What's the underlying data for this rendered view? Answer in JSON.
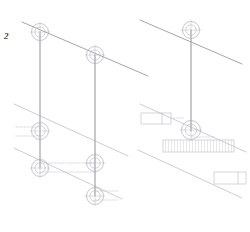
{
  "sheet": {
    "width": 250,
    "height": 232,
    "background": "#ffffff",
    "detail_number": "2",
    "detail_label_x": 4,
    "detail_label_y": 32
  },
  "styles": {
    "diagonal_color": "#8e8e96",
    "rail_color": "#b6b6be",
    "post_color": "#a9a9b2",
    "node_stroke": "#a9a9b4",
    "node_inner_stroke": "#bcbcc6",
    "leader_color": "#c2c2cc",
    "box_stroke": "#c0c0ca",
    "hatch_color": "#cfcfd8",
    "diagonal_width": 0.8,
    "rail_width": 0.7,
    "post_width": 1.3,
    "node_width": 0.65,
    "leader_width": 0.6,
    "box_width": 0.65
  },
  "panels": [
    {
      "name": "left-detail-panel",
      "diagonals": [
        {
          "name": "upper-chord-line",
          "x1": 22,
          "y1": 22,
          "x2": 148,
          "y2": 76
        },
        {
          "name": "mid-band-upper-line",
          "x1": 14,
          "y1": 104,
          "x2": 128,
          "y2": 156
        },
        {
          "name": "mid-band-lower-line",
          "x1": 14,
          "y1": 148,
          "x2": 122,
          "y2": 199
        }
      ],
      "posts": [
        {
          "name": "vertical-post-left",
          "x": 40,
          "y1": 32,
          "x2": 40,
          "y2": 168
        },
        {
          "name": "vertical-post-right",
          "x": 95,
          "y1": 55,
          "x2": 95,
          "y2": 196
        }
      ],
      "nodes": [
        {
          "name": "node-upper-left",
          "cx": 40,
          "cy": 32,
          "r": 8.5,
          "r_inner": 5.2
        },
        {
          "name": "node-upper-right",
          "cx": 95,
          "cy": 55,
          "r": 8.5,
          "r_inner": 5.2
        },
        {
          "name": "node-mid-left",
          "cx": 40,
          "cy": 131,
          "r": 8.5,
          "r_inner": 5.2
        },
        {
          "name": "node-lower-left",
          "cx": 40,
          "cy": 168,
          "r": 8.5,
          "r_inner": 5.2
        },
        {
          "name": "node-lower-mid",
          "cx": 95,
          "cy": 163,
          "r": 8.5,
          "r_inner": 5.2
        },
        {
          "name": "node-lower-right",
          "cx": 95,
          "cy": 196,
          "r": 8.5,
          "r_inner": 5.2
        }
      ],
      "leaders": [
        {
          "name": "leader-mid-left-upper",
          "x1": 16,
          "y1": 127,
          "x2": 40,
          "y2": 127
        },
        {
          "name": "leader-mid-left-lower",
          "x1": 16,
          "y1": 136,
          "x2": 40,
          "y2": 136
        },
        {
          "name": "leader-cross-upper",
          "x1": 40,
          "y1": 163,
          "x2": 95,
          "y2": 163
        },
        {
          "name": "leader-cross-lower",
          "x1": 40,
          "y1": 172,
          "x2": 95,
          "y2": 172
        },
        {
          "name": "leader-lower-right-upper",
          "x1": 95,
          "y1": 191,
          "x2": 118,
          "y2": 191
        },
        {
          "name": "leader-lower-right-lower",
          "x1": 95,
          "y1": 200,
          "x2": 118,
          "y2": 200
        }
      ]
    },
    {
      "name": "right-detail-panel",
      "diagonals": [
        {
          "name": "upper-chord-line",
          "x1": 140,
          "y1": 20,
          "x2": 242,
          "y2": 64
        },
        {
          "name": "mid-band-upper-line",
          "x1": 140,
          "y1": 104,
          "x2": 246,
          "y2": 152
        },
        {
          "name": "mid-band-lower-line",
          "x1": 138,
          "y1": 150,
          "x2": 242,
          "y2": 198
        }
      ],
      "posts": [
        {
          "name": "vertical-post-center",
          "x": 191,
          "y1": 30,
          "x2": 191,
          "y2": 131
        }
      ],
      "nodes": [
        {
          "name": "node-upper-center",
          "cx": 191,
          "cy": 30,
          "r": 8.5,
          "r_inner": 5.2
        },
        {
          "name": "node-mid-center",
          "cx": 191,
          "cy": 130,
          "r": 9.5,
          "r_inner": 5.8
        }
      ],
      "leaders": [
        {
          "name": "leader-mid-center-right",
          "x1": 191,
          "y1": 137,
          "x2": 214,
          "y2": 137
        }
      ],
      "boxes": [
        {
          "name": "callout-box-left",
          "x": 141,
          "y": 113,
          "w": 30,
          "h": 11,
          "hatched": false,
          "divider_x": 162
        },
        {
          "name": "callout-box-center",
          "x": 163,
          "y": 140,
          "w": 71,
          "h": 12,
          "hatched": true,
          "divider_x": null
        },
        {
          "name": "callout-box-right",
          "x": 214,
          "y": 172,
          "w": 32,
          "h": 12,
          "hatched": false,
          "divider_x": 238
        }
      ],
      "box_leaders": [
        {
          "name": "box-leader-left",
          "x1": 171,
          "y1": 118,
          "x2": 184,
          "y2": 118
        }
      ]
    }
  ]
}
